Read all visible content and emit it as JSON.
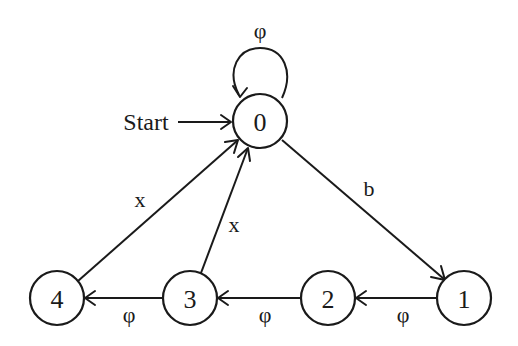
{
  "diagram": {
    "type": "state-transition-diagram",
    "start_label": "Start",
    "start_state": "0",
    "states": [
      {
        "id": "0",
        "label": "0",
        "x": 260,
        "y": 121
      },
      {
        "id": "1",
        "label": "1",
        "x": 464,
        "y": 298
      },
      {
        "id": "2",
        "label": "2",
        "x": 328,
        "y": 298
      },
      {
        "id": "3",
        "label": "3",
        "x": 190,
        "y": 298
      },
      {
        "id": "4",
        "label": "4",
        "x": 57,
        "y": 298
      }
    ],
    "transitions": [
      {
        "from": "0",
        "to": "0",
        "label": "φ"
      },
      {
        "from": "0",
        "to": "1",
        "label": "b"
      },
      {
        "from": "1",
        "to": "2",
        "label": "φ"
      },
      {
        "from": "2",
        "to": "3",
        "label": "φ"
      },
      {
        "from": "3",
        "to": "4",
        "label": "φ"
      },
      {
        "from": "3",
        "to": "0",
        "label": "x"
      },
      {
        "from": "4",
        "to": "0",
        "label": "x"
      }
    ]
  },
  "colors": {
    "ink": "#1a1a1a",
    "background": "#ffffff"
  }
}
